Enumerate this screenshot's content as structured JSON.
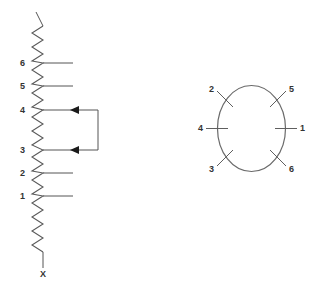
{
  "diagram": {
    "background_color": "#ffffff",
    "line_color": "#555555",
    "label_color": "#333333",
    "winding": {
      "name": "zigzag-winding",
      "description": "Vertical zigzag coil with six numbered taps and a bottom terminal",
      "top_lead_label": "",
      "bottom_terminal_label": "X",
      "taps": [
        {
          "label": "6",
          "y": 63
        },
        {
          "label": "5",
          "y": 86
        },
        {
          "label": "4",
          "y": 110
        },
        {
          "label": "3",
          "y": 150
        },
        {
          "label": "2",
          "y": 173
        },
        {
          "label": "1",
          "y": 196
        }
      ]
    },
    "jumper": {
      "name": "tap-jumper-link",
      "from_tap": "4",
      "to_tap": "3",
      "arrow_direction": "left",
      "arrow_count": 2
    },
    "terminal_circle": {
      "name": "terminal-block",
      "description": "Circular terminal arrangement with six numbered terminals",
      "terminals": [
        {
          "label": "1",
          "position": "right"
        },
        {
          "label": "2",
          "position": "upper-left"
        },
        {
          "label": "3",
          "position": "lower-left"
        },
        {
          "label": "4",
          "position": "left"
        },
        {
          "label": "5",
          "position": "upper-right"
        },
        {
          "label": "6",
          "position": "lower-right"
        }
      ]
    }
  }
}
